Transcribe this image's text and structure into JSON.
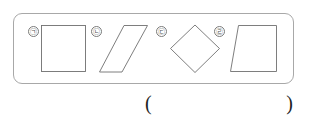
{
  "page": {
    "background_color": "#ffffff",
    "ink_color": "#6f6f6f",
    "text_color": "#1f1f1f"
  },
  "shape_box": {
    "name": "figure panel",
    "border_color": "#a8a8a8",
    "items": [
      {
        "ordinal": "㉠",
        "ordinal_reading": "giyeok",
        "shape_name": "square",
        "shape_type": "quadrilateral",
        "sides": 4
      },
      {
        "ordinal": "㉡",
        "ordinal_reading": "nieun",
        "shape_name": "parallelogram",
        "shape_type": "quadrilateral",
        "sides": 4
      },
      {
        "ordinal": "㉢",
        "ordinal_reading": "digeut",
        "shape_name": "rhombus",
        "shape_type": "quadrilateral",
        "sides": 4
      },
      {
        "ordinal": "㉣",
        "ordinal_reading": "rieul",
        "shape_name": "trapezoid",
        "shape_type": "quadrilateral",
        "sides": 4
      }
    ]
  },
  "answer": {
    "open_paren": "(",
    "close_paren": ")",
    "value": ""
  }
}
